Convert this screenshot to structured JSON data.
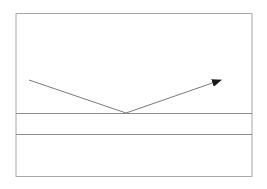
{
  "diagram": {
    "type": "ray-reflection",
    "colors": {
      "background": "#ffffff",
      "frame": "#a8a8a8",
      "surface_lines": "#8c8c8c",
      "ray": "#7a7a7a",
      "arrowhead": "#1a1a1a"
    },
    "elements": {
      "frame": "outer-border",
      "upper_surface": "layer-top-interface",
      "lower_surface": "layer-bottom-interface",
      "incident_ray": "incoming-ray",
      "reflected_ray": "reflected-ray-with-arrow"
    }
  }
}
